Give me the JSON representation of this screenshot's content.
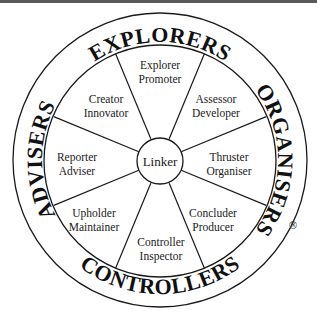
{
  "diagram": {
    "outer_labels": {
      "top": "EXPLORERS",
      "right": "ORGANISERS",
      "bottom": "CONTROLLERS",
      "left": "ADVISERS"
    },
    "center": "Linker",
    "sectors": [
      {
        "line1": "Explorer",
        "line2": "Promoter"
      },
      {
        "line1": "Assessor",
        "line2": "Developer"
      },
      {
        "line1": "Thruster",
        "line2": "Organiser"
      },
      {
        "line1": "Concluder",
        "line2": "Producer"
      },
      {
        "line1": "Controller",
        "line2": "Inspector"
      },
      {
        "line1": "Upholder",
        "line2": "Maintainer"
      },
      {
        "line1": "Reporter",
        "line2": "Adviser"
      },
      {
        "line1": "Creator",
        "line2": "Innovator"
      }
    ],
    "registered_mark": "®",
    "colors": {
      "ink": "#1a1a1a",
      "background": "#ffffff",
      "top_bar": "#5a5a5a"
    }
  }
}
